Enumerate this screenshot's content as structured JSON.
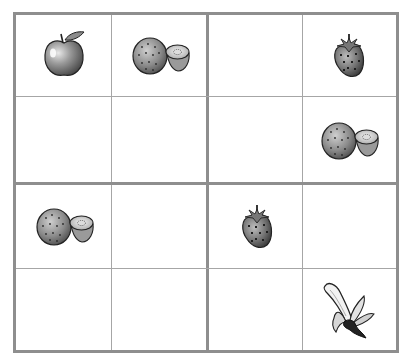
{
  "puzzle": {
    "type": "fruit-sudoku-4x4",
    "size": 4,
    "grid": [
      [
        "apple",
        "kiwi",
        "",
        "strawberry"
      ],
      [
        "",
        "",
        "",
        "kiwi"
      ],
      [
        "kiwi",
        "",
        "strawberry",
        ""
      ],
      [
        "",
        "",
        "",
        "banana"
      ]
    ],
    "symbols": [
      "apple",
      "kiwi",
      "strawberry",
      "banana"
    ]
  },
  "colors": {
    "thick_line": "#8e8e8e",
    "thin_line": "#a6a6a6",
    "background": "#ffffff"
  }
}
